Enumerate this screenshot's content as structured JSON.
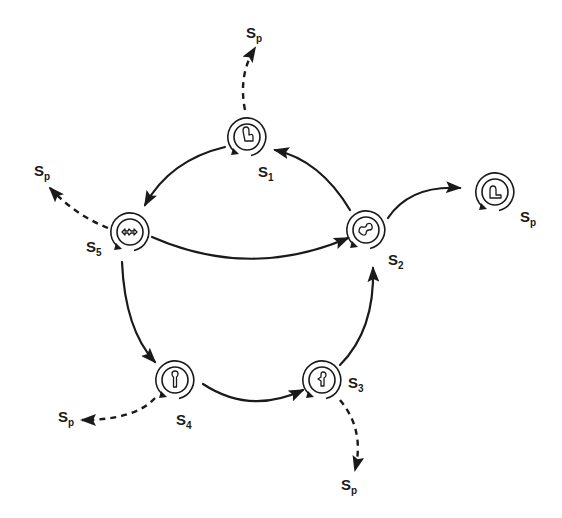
{
  "diagram": {
    "type": "state-cycle",
    "nodes": [
      {
        "id": "S1",
        "label": "S",
        "sub": "1",
        "icon": "tulip-shape-icon"
      },
      {
        "id": "S2",
        "label": "S",
        "sub": "2",
        "icon": "wavy-loop-shape-icon"
      },
      {
        "id": "S3",
        "label": "S",
        "sub": "3",
        "icon": "keyhole-shape-icon"
      },
      {
        "id": "S4",
        "label": "S",
        "sub": "4",
        "icon": "keyhole-upright-icon"
      },
      {
        "id": "S5",
        "label": "S",
        "sub": "5",
        "icon": "double-arrow-shape-icon"
      },
      {
        "id": "Sp_node",
        "label": "S",
        "sub": "p",
        "icon": "step-shape-icon"
      }
    ],
    "edges": [
      {
        "from": "S2",
        "to": "S1",
        "style": "solid"
      },
      {
        "from": "S1",
        "to": "S5",
        "style": "solid"
      },
      {
        "from": "S5",
        "to": "S2",
        "style": "solid"
      },
      {
        "from": "S5",
        "to": "S4",
        "style": "solid"
      },
      {
        "from": "S4",
        "to": "S3",
        "style": "solid"
      },
      {
        "from": "S3",
        "to": "S2",
        "style": "solid"
      },
      {
        "from": "S2",
        "to": "Sp_node",
        "style": "solid"
      },
      {
        "from": "S1",
        "to": "Sp",
        "style": "dashed"
      },
      {
        "from": "S5",
        "to": "Sp",
        "style": "dashed"
      },
      {
        "from": "S4",
        "to": "Sp",
        "style": "dashed"
      },
      {
        "from": "S3",
        "to": "Sp",
        "style": "dashed"
      }
    ],
    "sp_labels": [
      {
        "label": "S",
        "sub": "p"
      },
      {
        "label": "S",
        "sub": "p"
      },
      {
        "label": "S",
        "sub": "p"
      },
      {
        "label": "S",
        "sub": "p"
      },
      {
        "label": "S",
        "sub": "p"
      }
    ],
    "color": "#1a1a1a"
  }
}
